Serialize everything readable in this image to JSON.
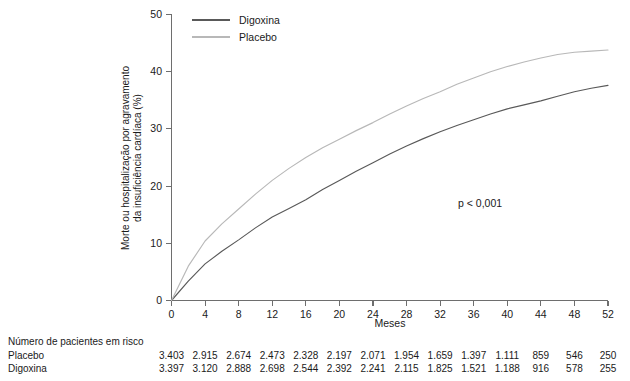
{
  "chart_data": {
    "type": "line",
    "title": "",
    "xlabel": "Meses",
    "ylabel": "Morte ou hospitalização por agravamento da insuficiência cardíaca (%)",
    "xlim": [
      0,
      52
    ],
    "ylim": [
      0,
      50
    ],
    "xticks": [
      0,
      4,
      8,
      12,
      16,
      20,
      24,
      28,
      32,
      36,
      40,
      44,
      48,
      52
    ],
    "yticks": [
      0,
      10,
      20,
      30,
      40,
      50
    ],
    "grid": false,
    "legend_position": "top-left",
    "annotation": "p < 0,001",
    "x": [
      0,
      2,
      4,
      6,
      8,
      10,
      12,
      14,
      16,
      18,
      20,
      22,
      24,
      26,
      28,
      30,
      32,
      34,
      36,
      38,
      40,
      42,
      44,
      46,
      48,
      50,
      52
    ],
    "series": [
      {
        "name": "Digoxina",
        "color": "#595959",
        "values": [
          0,
          3.4,
          6.4,
          8.6,
          10.6,
          12.7,
          14.6,
          16.1,
          17.6,
          19.4,
          21.0,
          22.6,
          24.1,
          25.6,
          27.0,
          28.3,
          29.5,
          30.6,
          31.6,
          32.6,
          33.5,
          34.2,
          34.9,
          35.7,
          36.5,
          37.1,
          37.6
        ]
      },
      {
        "name": "Placebo",
        "color": "#b8b8b8",
        "values": [
          0,
          6.0,
          10.4,
          13.4,
          16.0,
          18.6,
          21.0,
          23.1,
          25.0,
          26.7,
          28.2,
          29.7,
          31.1,
          32.6,
          34.0,
          35.3,
          36.5,
          37.8,
          38.9,
          40.0,
          40.9,
          41.7,
          42.4,
          43.0,
          43.4,
          43.6,
          43.8
        ]
      }
    ]
  },
  "legend": {
    "items": [
      {
        "label": "Digoxina",
        "color": "#595959"
      },
      {
        "label": "Placebo",
        "color": "#b8b8b8"
      }
    ]
  },
  "axes": {
    "x_title": "Meses",
    "y_title_line1": "Morte ou hospitalização por agravamento",
    "y_title_line2": "da insuficiência cardíaca (%)",
    "x_tick_labels": [
      "0",
      "4",
      "8",
      "12",
      "16",
      "20",
      "24",
      "28",
      "32",
      "36",
      "40",
      "44",
      "48",
      "52"
    ],
    "y_tick_labels": [
      "0",
      "10",
      "20",
      "30",
      "40",
      "50"
    ]
  },
  "annotations": {
    "p_value": "p < 0,001"
  },
  "risk_table": {
    "title": "Número de pacientes em risco",
    "rows": [
      {
        "label": "Placebo",
        "values": [
          "3.403",
          "2.915",
          "2.674",
          "2.473",
          "2.328",
          "2.197",
          "2.071",
          "1.954",
          "1.659",
          "1.397",
          "1.111",
          "859",
          "546",
          "250"
        ]
      },
      {
        "label": "Digoxina",
        "values": [
          "3.397",
          "3.120",
          "2.888",
          "2.698",
          "2.544",
          "2.392",
          "2.241",
          "2.115",
          "1.825",
          "1.521",
          "1.188",
          "916",
          "578",
          "255"
        ]
      }
    ]
  }
}
